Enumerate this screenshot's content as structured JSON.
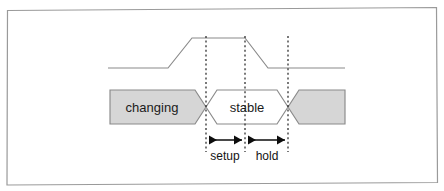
{
  "figure": {
    "border_color": "#9a9a9a",
    "background_color": "#ffffff"
  },
  "clock": {
    "name": "clock-waveform",
    "stroke_color": "#8a8a8a",
    "low_y": 68,
    "high_y": 38,
    "x_start": 108,
    "x_end": 345,
    "rise_start_x": 168,
    "rise_end_x": 192,
    "fall_start_x": 245,
    "fall_end_x": 268
  },
  "bus": {
    "name": "data-bus-waveform",
    "top_y": 90,
    "bottom_y": 124,
    "fill_gray": "#d6d6d6",
    "fill_white": "#ffffff",
    "stroke_color": "#8a8a8a",
    "x_start": 110,
    "x_end": 345,
    "left_cross_x": 206,
    "right_cross_x": 288,
    "segments": [
      {
        "label": "changing",
        "state": "unstable",
        "fill": "#d6d6d6",
        "text_x": 152,
        "text_y": 112
      },
      {
        "label": "stable",
        "state": "valid",
        "fill": "#ffffff",
        "text_x": 247,
        "text_y": 112
      },
      {
        "label": "",
        "state": "unstable",
        "fill": "#d6d6d6",
        "text_x": 320,
        "text_y": 112
      }
    ]
  },
  "markers": [
    {
      "name": "marker-setup-start",
      "x": 206,
      "y_top": 36,
      "y_bottom": 152
    },
    {
      "name": "marker-clock-edge",
      "x": 245,
      "y_top": 36,
      "y_bottom": 152
    },
    {
      "name": "marker-hold-end",
      "x": 288,
      "y_top": 36,
      "y_bottom": 152
    }
  ],
  "measurements": [
    {
      "name": "setup-time",
      "label": "setup",
      "x_from": 206,
      "x_to": 245,
      "arrow_y": 140,
      "label_x": 225,
      "label_y": 160
    },
    {
      "name": "hold-time",
      "label": "hold",
      "x_from": 245,
      "x_to": 288,
      "arrow_y": 140,
      "label_x": 267,
      "label_y": 160
    }
  ]
}
